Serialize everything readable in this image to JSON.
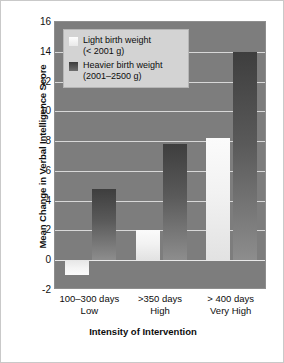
{
  "chart_data": {
    "type": "bar",
    "title": "",
    "xlabel": "Intensity of Intervention",
    "ylabel": "Mean Change in Verbal Intelligence Score",
    "categories": [
      "100–300 days",
      ">350 days",
      "> 400 days"
    ],
    "category_sublabels": [
      "Low",
      "High",
      "Very High"
    ],
    "ylim": [
      -2,
      16
    ],
    "yticks": [
      16,
      14,
      12,
      10,
      8,
      6,
      4,
      2,
      0,
      -2
    ],
    "grid": true,
    "legend_position": "top-left",
    "series": [
      {
        "name": "Light birth weight",
        "detail": "(< 2001 g)",
        "color": "#f4f4f4",
        "values": [
          -1.0,
          2.0,
          8.2
        ]
      },
      {
        "name": "Heavier birth weight",
        "detail": "(2001–2500 g)",
        "color": "#5a5a5a",
        "values": [
          4.8,
          7.8,
          14.0
        ]
      }
    ]
  },
  "legend": {
    "items": [
      {
        "label": "Light birth weight",
        "detail": "(< 2001 g)"
      },
      {
        "label": "Heavier birth weight",
        "detail": "(2001–2500 g)"
      }
    ]
  }
}
